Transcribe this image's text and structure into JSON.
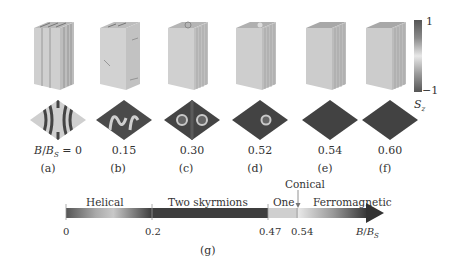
{
  "panels": [
    {
      "id": "a",
      "value_label": "B/B_S = 0",
      "sub": "(a)",
      "state": "helical"
    },
    {
      "id": "b",
      "value_label": "0.15",
      "sub": "(b)",
      "state": "helical-distorted"
    },
    {
      "id": "c",
      "value_label": "0.30",
      "sub": "(c)",
      "state": "two-skyrmions"
    },
    {
      "id": "d",
      "value_label": "0.52",
      "sub": "(d)",
      "state": "one-skyrmion"
    },
    {
      "id": "e",
      "value_label": "0.54",
      "sub": "(e)",
      "state": "ferromagnetic"
    },
    {
      "id": "f",
      "value_label": "0.60",
      "sub": "(f)",
      "state": "ferromagnetic"
    }
  ],
  "first_value": {
    "B": "B",
    "slash": "/",
    "Bs": "B",
    "s": "S",
    "eq": " = 0"
  },
  "colorbar": {
    "max": "1",
    "min": "−1",
    "label": "S",
    "label_sub": "z"
  },
  "phase_diagram": {
    "label": "(g)",
    "phases": [
      "Helical",
      "Two skyrmions",
      "One",
      "Ferromagnetic"
    ],
    "annotation": "Conical",
    "ticks": [
      "0",
      "0.2",
      "0.47",
      "0.54"
    ],
    "axis_label": {
      "B": "B",
      "slash": "/",
      "Bs": "B",
      "s": "S"
    }
  },
  "colors": {
    "dark": "#3a3a3a",
    "mid": "#8a8a8a",
    "light": "#d8d8d8",
    "cube_face": "#c8c8c8"
  }
}
